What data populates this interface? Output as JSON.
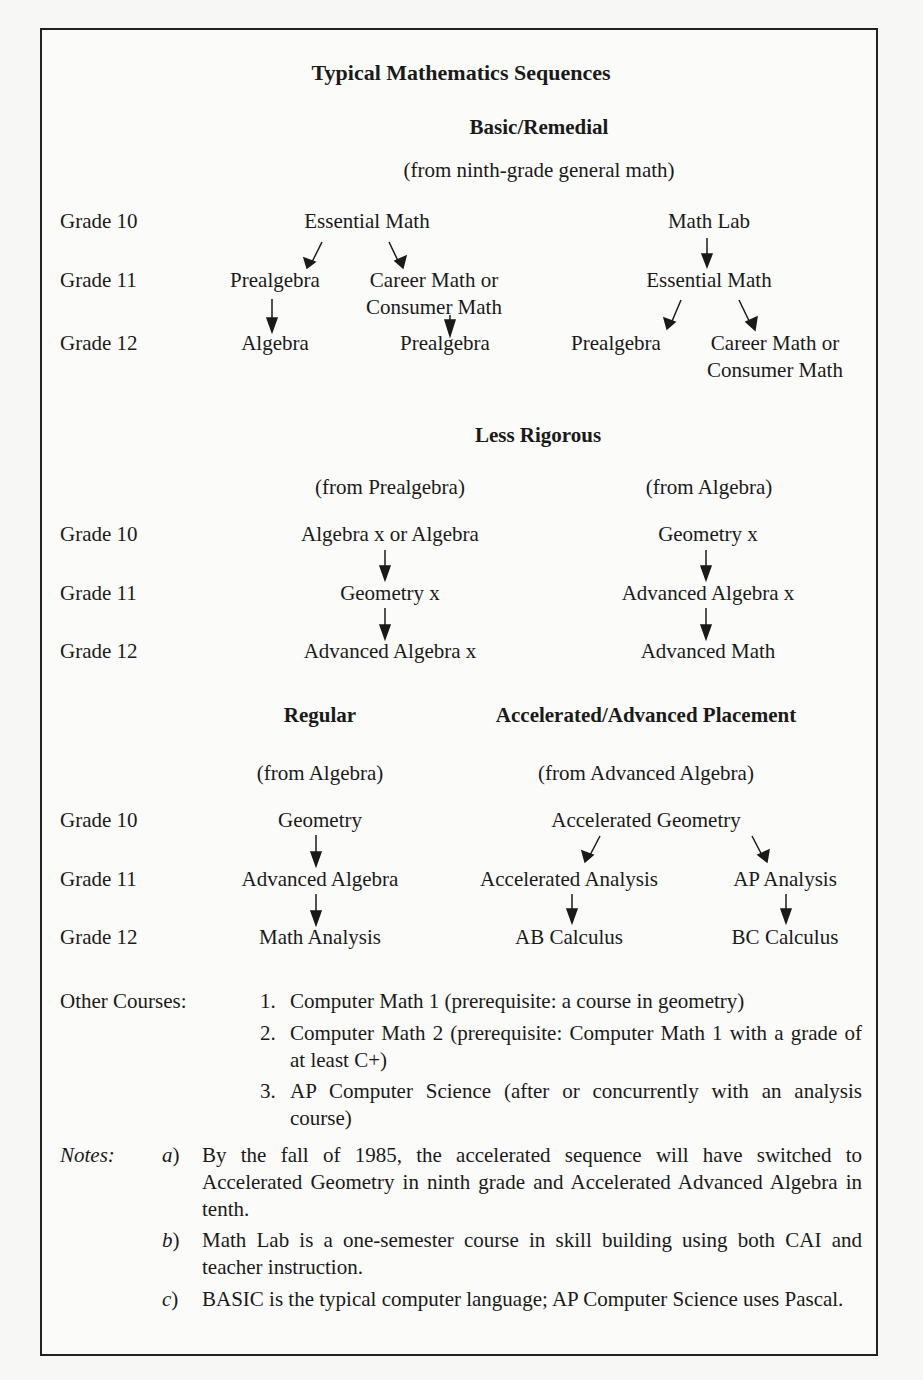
{
  "title": "Typical Mathematics Sequences",
  "grade_labels": [
    "Grade 10",
    "Grade 11",
    "Grade 12"
  ],
  "basic": {
    "heading": "Basic/Remedial",
    "from": "(from ninth-grade general math)",
    "left": {
      "g10": "Essential Math",
      "g11a": "Prealgebra",
      "g11b_line1": "Career Math or",
      "g11b_line2": "Consumer Math",
      "g12a": "Algebra",
      "g12b": "Prealgebra"
    },
    "right": {
      "g10": "Math Lab",
      "g11": "Essential Math",
      "g12a": "Prealgebra",
      "g12b_line1": "Career Math or",
      "g12b_line2": "Consumer Math"
    }
  },
  "less": {
    "heading": "Less Rigorous",
    "left": {
      "from": "(from Prealgebra)",
      "g10": "Algebra x or Algebra",
      "g11": "Geometry x",
      "g12": "Advanced Algebra x"
    },
    "right": {
      "from": "(from Algebra)",
      "g10": "Geometry x",
      "g11": "Advanced Algebra x",
      "g12": "Advanced Math"
    }
  },
  "regular": {
    "heading": "Regular",
    "from": "(from Algebra)",
    "g10": "Geometry",
    "g11": "Advanced Algebra",
    "g12": "Math Analysis"
  },
  "accel": {
    "heading": "Accelerated/Advanced Placement",
    "from": "(from Advanced Algebra)",
    "g10": "Accelerated Geometry",
    "g11a": "Accelerated Analysis",
    "g11b": "AP Analysis",
    "g12a": "AB Calculus",
    "g12b": "BC Calculus"
  },
  "other": {
    "label": "Other Courses:",
    "items": [
      {
        "num": "1.",
        "text": "Computer Math 1 (prerequisite: a course in geometry)"
      },
      {
        "num": "2.",
        "text": "Computer Math 2 (prerequisite: Computer Math 1 with a grade of at least C+)"
      },
      {
        "num": "3.",
        "text": "AP Computer Science (after or concurrently with an analysis course)"
      }
    ]
  },
  "notes": {
    "label": "Notes:",
    "items": [
      {
        "letter": "a",
        "text": "By the fall of 1985, the accelerated sequence will have switched to Accelerated Geometry in ninth grade and Accelerated Advanced Algebra in tenth."
      },
      {
        "letter": "b",
        "text": "Math Lab is a one-semester course in skill building using both CAI and teacher instruction."
      },
      {
        "letter": "c",
        "text": "BASIC is the typical computer language; AP Computer Science uses Pascal."
      }
    ]
  }
}
